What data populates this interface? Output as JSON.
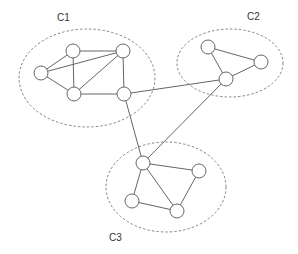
{
  "diagram": {
    "type": "clustered-graph",
    "clusters": [
      {
        "id": "C1",
        "label": "C1",
        "cx": 87,
        "cy": 78,
        "rx": 68,
        "ry": 49,
        "label_x": 57,
        "label_y": 21
      },
      {
        "id": "C2",
        "label": "C2",
        "cx": 230,
        "cy": 63,
        "rx": 53,
        "ry": 34,
        "label_x": 247,
        "label_y": 20
      },
      {
        "id": "C3",
        "label": "C3",
        "cx": 166,
        "cy": 187,
        "rx": 60,
        "ry": 45,
        "label_x": 109,
        "label_y": 241
      }
    ],
    "nodes": [
      {
        "id": "A",
        "cluster": "C1",
        "x": 73,
        "y": 51
      },
      {
        "id": "B",
        "cluster": "C1",
        "x": 123,
        "y": 51
      },
      {
        "id": "C",
        "cluster": "C1",
        "x": 41,
        "y": 73
      },
      {
        "id": "D",
        "cluster": "C1",
        "x": 74,
        "y": 94
      },
      {
        "id": "E",
        "cluster": "C1",
        "x": 124,
        "y": 94
      },
      {
        "id": "F",
        "cluster": "C2",
        "x": 208,
        "y": 47
      },
      {
        "id": "G",
        "cluster": "C2",
        "x": 261,
        "y": 62
      },
      {
        "id": "H",
        "cluster": "C2",
        "x": 226,
        "y": 79
      },
      {
        "id": "I",
        "cluster": "C3",
        "x": 143,
        "y": 163
      },
      {
        "id": "J",
        "cluster": "C3",
        "x": 199,
        "y": 171
      },
      {
        "id": "K",
        "cluster": "C3",
        "x": 132,
        "y": 201
      },
      {
        "id": "L",
        "cluster": "C3",
        "x": 177,
        "y": 211
      }
    ],
    "edges": [
      [
        "A",
        "B"
      ],
      [
        "A",
        "C"
      ],
      [
        "A",
        "D"
      ],
      [
        "C",
        "B"
      ],
      [
        "C",
        "D"
      ],
      [
        "D",
        "B"
      ],
      [
        "D",
        "E"
      ],
      [
        "B",
        "E"
      ],
      [
        "F",
        "G"
      ],
      [
        "F",
        "H"
      ],
      [
        "G",
        "H"
      ],
      [
        "I",
        "J"
      ],
      [
        "I",
        "K"
      ],
      [
        "I",
        "L"
      ],
      [
        "K",
        "L"
      ],
      [
        "J",
        "L"
      ],
      [
        "E",
        "H"
      ],
      [
        "E",
        "I"
      ],
      [
        "H",
        "I"
      ]
    ],
    "node_radius": 7,
    "colors": {
      "stroke": "#666666",
      "ellipse": "#777777",
      "label": "#333333",
      "background": "#ffffff"
    }
  }
}
